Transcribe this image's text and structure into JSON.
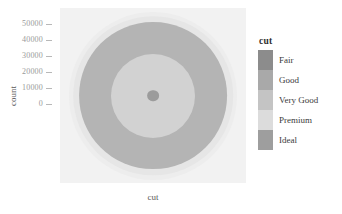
{
  "chart_data": {
    "type": "pie",
    "title": "",
    "subtitle": "",
    "xlabel": "cut",
    "ylabel": "count",
    "coord": "polar-bullseye",
    "grid": false,
    "legend_position": "right",
    "legend_title": "cut",
    "categories": [
      "Fair",
      "Good",
      "Very Good",
      "Premium",
      "Ideal"
    ],
    "values": [
      1610,
      4906,
      12082,
      13791,
      21551
    ],
    "ylim": [
      0,
      53940
    ],
    "yticks": [
      0,
      10000,
      20000,
      30000,
      40000,
      50000
    ],
    "ytick_labels": [
      "0",
      "10000",
      "20000",
      "30000",
      "40000",
      "50000"
    ],
    "series": [
      {
        "name": "count",
        "values": [
          1610,
          4906,
          12082,
          13791,
          21551
        ]
      }
    ],
    "colors": [
      "#8c8c8c",
      "#a9a9a9",
      "#c4c4c4",
      "#dcdcdc",
      "#9e9e9e"
    ],
    "panel_background": "#f2f2f2",
    "rings": [
      {
        "label": "Fair",
        "color": "#ededed",
        "radius_pct": 100
      },
      {
        "label": "Good",
        "color": "#e6e6e6",
        "radius_pct": 95
      },
      {
        "label": "Very Good",
        "color": "#b4b4b4",
        "radius_pct": 88
      },
      {
        "label": "Premium",
        "color": "#d2d2d2",
        "radius_pct": 50
      },
      {
        "label": "Ideal",
        "color": "#9c9c9c",
        "radius_pct": 7
      }
    ]
  },
  "axes": {
    "y_title": "count",
    "x_title": "cut",
    "y_tick_labels": [
      "50000",
      "40000",
      "30000",
      "20000",
      "10000",
      "0"
    ]
  },
  "legend": {
    "title": "cut",
    "items": [
      {
        "label": "Fair",
        "color": "#8c8c8c"
      },
      {
        "label": "Good",
        "color": "#a9a9a9"
      },
      {
        "label": "Very Good",
        "color": "#c4c4c4"
      },
      {
        "label": "Premium",
        "color": "#dcdcdc"
      },
      {
        "label": "Ideal",
        "color": "#9e9e9e"
      }
    ]
  }
}
